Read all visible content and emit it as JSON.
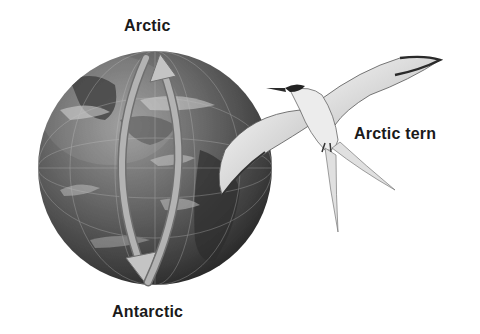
{
  "diagram": {
    "labels": {
      "north": "Arctic",
      "south": "Antarctic",
      "bird": "Arctic tern"
    },
    "elements": {
      "globe": "earth-globe",
      "arrow_southward": "arrow pointing from Arctic to Antarctic (left arc)",
      "arrow_northward": "arrow pointing from Antarctic to Arctic (right arc)",
      "bird": "flying arctic tern illustration"
    },
    "colors": {
      "background": "#ffffff",
      "text": "#1a1a1a",
      "globe_dark": "#3a3a3a",
      "globe_mid": "#6e6e6e",
      "globe_light": "#bcbcbc",
      "arrow": "#a9a9a9",
      "bird_body": "#e6e6e6"
    }
  }
}
